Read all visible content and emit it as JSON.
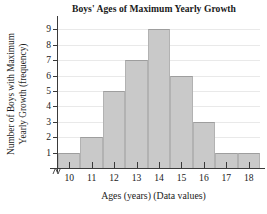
{
  "chart_data": {
    "type": "bar",
    "title": "Boys' Ages of Maximum Yearly Growth",
    "xlabel": "Ages (years) (Data values)",
    "ylabel_lines": [
      "Number of Boys with Maximum",
      "Yearly Growth (frequency)"
    ],
    "ylabel": "Number of Boys with Maximum Yearly Growth (frequency)",
    "categories": [
      "10",
      "11",
      "12",
      "13",
      "14",
      "15",
      "16",
      "17",
      "18"
    ],
    "values": [
      1,
      2,
      5,
      7,
      9,
      6,
      3,
      1,
      1
    ],
    "yticks": [
      "9",
      "8",
      "7",
      "6",
      "5",
      "4",
      "3",
      "2",
      "1"
    ],
    "ylim": [
      0,
      9.6
    ],
    "grid": true,
    "legend": null,
    "bar_color": "#c9c9c9",
    "bar_edge_color": "#9e9e9e",
    "axis_color": "#3a3a3a",
    "grid_color": "#e9e9e9",
    "axis_break": true
  }
}
